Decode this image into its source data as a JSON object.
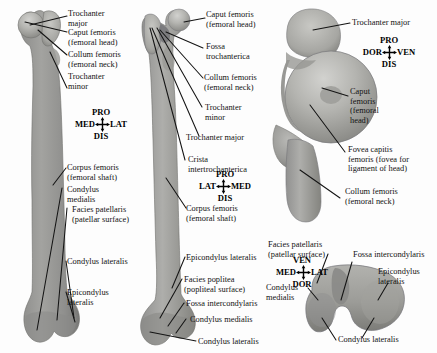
{
  "figure": {
    "background_color": "#fdfdfd",
    "bone_fill_color": "#9a9a98",
    "bone_fill_light": "#b5b5b2",
    "leader_line_color": "#141414",
    "text_color": "#121212"
  },
  "panels": [
    {
      "id": "left",
      "name": "anterior-view",
      "compass": {
        "top": "PRO",
        "left": "MED",
        "right": "LAT",
        "bottom": "DIS"
      },
      "labels": [
        "Trochanter\nmajor",
        "Caput femoris\n(femoral head)",
        "Collum femoris\n(femoral neck)",
        "Trochanter\nminor",
        "Corpus femoris\n(femoral shaft)",
        "Condylus\nmedialis",
        "Facies patellaris\n(patellar surface)",
        "Condylus lateralis",
        "Epicondylus\nlateralis"
      ]
    },
    {
      "id": "middle",
      "name": "posterior-view",
      "compass": {
        "top": "PRO",
        "left": "LAT",
        "right": "MED",
        "bottom": "DIS"
      },
      "labels": [
        "Caput femoris\n(femoral head)",
        "Fossa\ntrochanterica",
        "Collum femoris\n(femoral neck)",
        "Trochanter\nminor",
        "Trochanter major",
        "Crista\nintertrochanterica",
        "Corpus femoris\n(femoral shaft)",
        "Epicondylus lateralis",
        "Facies poplitea\n(popliteal surface)",
        "Fossa intercondylaris",
        "Condylus medialis",
        "Condylus lateralis"
      ]
    },
    {
      "id": "right-proximal",
      "name": "proximal-end-view",
      "compass": {
        "top": "PRO",
        "left": "DOR",
        "right": "VEN",
        "bottom": "DIS"
      },
      "labels": [
        "Trochanter major",
        "Caput\nfemoris\n(femoral\nhead)",
        "Fovea capitis\nfemoris (fovea for\nligament of head)",
        "Collum femoris\n(femoral neck)"
      ]
    },
    {
      "id": "right-distal",
      "name": "distal-end-view",
      "compass": {
        "top": "VEN",
        "left": "MED",
        "right": "LAT",
        "bottom": "DOR"
      },
      "labels": [
        "Facies patellaris\n(patellar surface)",
        "Fossa intercondylaris",
        "Epicondylus\nlateralis",
        "Condylus\nmedialis",
        "Condylus lateralis"
      ]
    }
  ],
  "text": {
    "trochanter_major_2line": "Trochanter\nmajor",
    "caput_femoris": "Caput femoris\n(femoral head)",
    "collum_femoris": "Collum femoris\n(femoral neck)",
    "trochanter_minor": "Trochanter\nminor",
    "corpus_femoris": "Corpus femoris\n(femoral shaft)",
    "condylus_medialis_2line": "Condylus\nmedialis",
    "facies_patellaris": "Facies patellaris\n(patellar surface)",
    "condylus_lateralis": "Condylus lateralis",
    "epicondylus_lateralis_2line": "Epicondylus\nlateralis",
    "fossa_trochanterica": "Fossa\ntrochanterica",
    "trochanter_major_1line": "Trochanter major",
    "crista_intertrochanterica": "Crista\nintertrochanterica",
    "epicondylus_lateralis_1line": "Epicondylus lateralis",
    "facies_poplitea": "Facies poplitea\n(popliteal surface)",
    "fossa_intercondylaris": "Fossa intercondylaris",
    "condylus_medialis_1line": "Condylus medialis",
    "caput_femoris_4line": "Caput\nfemoris\n(femoral\nhead)",
    "fovea_capitis": "Fovea capitis\nfemoris (fovea for\nligament of head)",
    "epicondylus_lateralis_r": "Epicondylus\nlateralis",
    "condylus_medialis_r": "Condylus\nmedialis"
  },
  "compass_values": {
    "left": {
      "n": "PRO",
      "w": "MED",
      "e": "LAT",
      "s": "DIS"
    },
    "middle": {
      "n": "PRO",
      "w": "LAT",
      "e": "MED",
      "s": "DIS"
    },
    "right_top": {
      "n": "PRO",
      "w": "DOR",
      "e": "VEN",
      "s": "DIS"
    },
    "right_bottom": {
      "n": "VEN",
      "w": "MED",
      "e": "LAT",
      "s": "DOR"
    }
  }
}
